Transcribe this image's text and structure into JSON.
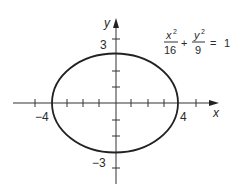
{
  "diagram": {
    "type": "ellipse-graph",
    "equation": {
      "term1_numerator": "x",
      "term1_exponent": "2",
      "term1_denominator": "16",
      "operator": "+",
      "term2_numerator": "y",
      "term2_exponent": "2",
      "term2_denominator": "9",
      "equals": "=",
      "rhs": "1"
    },
    "axes": {
      "x_label": "x",
      "y_label": "y"
    },
    "tick_labels": {
      "x_neg": "−4",
      "x_pos": "4",
      "y_pos": "3",
      "y_neg": "−3"
    },
    "ellipse": {
      "semi_major_a": 4,
      "semi_minor_b": 3,
      "center": [
        0,
        0
      ]
    },
    "colors": {
      "stroke": "#222222",
      "background": "#ffffff"
    }
  }
}
